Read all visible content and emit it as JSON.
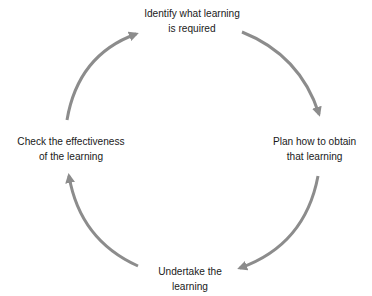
{
  "diagram": {
    "type": "cycle",
    "arrow_color": "#8c8c8c",
    "text_color": "#1a1a1a",
    "nodes": [
      {
        "id": "identify",
        "line1": "Identify what learning",
        "line2": "is required"
      },
      {
        "id": "plan",
        "line1": "Plan how to obtain",
        "line2": "that learning"
      },
      {
        "id": "undertake",
        "line1": "Undertake the",
        "line2": "learning"
      },
      {
        "id": "check",
        "line1": "Check the effectiveness",
        "line2": "of the learning"
      }
    ],
    "edges": [
      {
        "from": "identify",
        "to": "plan"
      },
      {
        "from": "plan",
        "to": "undertake"
      },
      {
        "from": "undertake",
        "to": "check"
      },
      {
        "from": "check",
        "to": "identify"
      }
    ]
  }
}
